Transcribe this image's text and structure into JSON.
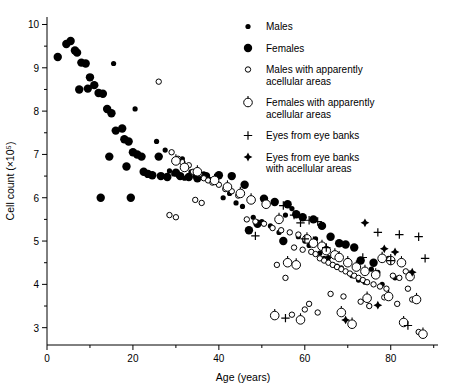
{
  "figure": {
    "background": "#ffffff",
    "ink": "#000000"
  },
  "chart_data": {
    "type": "scatter",
    "title": "",
    "xlabel": "Age (years)",
    "ylabel": "Cell count (×10⁵)",
    "xlim": [
      0,
      91
    ],
    "ylim": [
      2.6,
      10.15
    ],
    "grid": false,
    "legend_position": "top-right-inside",
    "x_major_ticks": [
      0,
      20,
      40,
      60,
      80
    ],
    "x_major_tick_labels": [
      "0",
      "20",
      "40",
      "60",
      "80"
    ],
    "x_minor_ticks": [
      10,
      30,
      50,
      70,
      90
    ],
    "y_major_ticks": [
      3,
      4,
      5,
      6,
      7,
      8,
      9,
      10
    ],
    "y_major_tick_labels": [
      "3",
      "4",
      "5",
      "6",
      "7",
      "8",
      "9",
      "10"
    ],
    "y_minor_ticks": [
      3.5,
      4.5,
      5.5,
      6.5,
      7.5,
      8.5,
      9.5
    ],
    "series": [
      {
        "name": "Males",
        "marker": "filled-circle-small",
        "color": "#000000",
        "points": [
          [
            15.5,
            9.1
          ],
          [
            20.5,
            8.05
          ],
          [
            25.5,
            7.3
          ],
          [
            27.5,
            7.1
          ],
          [
            28.5,
            6.62
          ],
          [
            29.5,
            6.55
          ],
          [
            30.5,
            6.52
          ],
          [
            31.5,
            6.9
          ],
          [
            32.0,
            6.45
          ],
          [
            33.5,
            6.6
          ],
          [
            34.5,
            6.5
          ],
          [
            36.5,
            6.55
          ],
          [
            38.0,
            6.42
          ],
          [
            39.5,
            6.35
          ],
          [
            41.0,
            6.0
          ],
          [
            42.5,
            6.1
          ],
          [
            44.0,
            5.88
          ],
          [
            45.5,
            5.8
          ],
          [
            48.0,
            5.55
          ],
          [
            50.0,
            5.45
          ],
          [
            52.0,
            5.35
          ],
          [
            54.0,
            5.2
          ],
          [
            55.5,
            5.6
          ],
          [
            57.0,
            5.75
          ],
          [
            58.5,
            5.1
          ],
          [
            60.0,
            5.0
          ],
          [
            61.0,
            4.9
          ],
          [
            62.5,
            5.05
          ],
          [
            63.5,
            4.72
          ],
          [
            64.5,
            4.6
          ],
          [
            65.5,
            4.62
          ],
          [
            66.5,
            4.45
          ],
          [
            67.5,
            4.42
          ],
          [
            68.5,
            4.38
          ],
          [
            70.0,
            4.55
          ],
          [
            71.0,
            4.2
          ],
          [
            72.5,
            4.1
          ],
          [
            74.0,
            4.05
          ],
          [
            75.5,
            4.35
          ],
          [
            77.0,
            4.28
          ],
          [
            78.0,
            4.0
          ],
          [
            79.5,
            4.6
          ],
          [
            81.0,
            4.15
          ]
        ]
      },
      {
        "name": "Females",
        "marker": "filled-circle-large",
        "color": "#000000",
        "points": [
          [
            2.5,
            9.25
          ],
          [
            4.5,
            9.55
          ],
          [
            5.5,
            9.62
          ],
          [
            6.5,
            9.4
          ],
          [
            7.0,
            9.35
          ],
          [
            8.0,
            9.12
          ],
          [
            9.0,
            9.1
          ],
          [
            10.0,
            8.78
          ],
          [
            11.0,
            8.6
          ],
          [
            12.0,
            8.42
          ],
          [
            13.0,
            8.4
          ],
          [
            9.5,
            8.52
          ],
          [
            7.5,
            8.5
          ],
          [
            14.0,
            8.05
          ],
          [
            15.0,
            7.95
          ],
          [
            16.0,
            7.55
          ],
          [
            17.5,
            7.6
          ],
          [
            18.0,
            7.35
          ],
          [
            19.0,
            7.3
          ],
          [
            20.0,
            7.05
          ],
          [
            21.0,
            7.0
          ],
          [
            22.0,
            6.95
          ],
          [
            22.5,
            6.6
          ],
          [
            23.5,
            6.55
          ],
          [
            24.5,
            6.52
          ],
          [
            26.0,
            6.95
          ],
          [
            14.5,
            6.95
          ],
          [
            18.5,
            6.72
          ],
          [
            26.5,
            6.5
          ],
          [
            28.0,
            6.48
          ],
          [
            30.0,
            6.58
          ],
          [
            31.0,
            6.5
          ],
          [
            33.0,
            6.48
          ],
          [
            35.0,
            6.45
          ],
          [
            37.0,
            6.5
          ],
          [
            40.0,
            6.52
          ],
          [
            43.0,
            6.5
          ],
          [
            46.0,
            6.3
          ],
          [
            12.5,
            6.0
          ],
          [
            19.5,
            6.0
          ],
          [
            50.5,
            5.98
          ],
          [
            53.0,
            5.9
          ],
          [
            56.0,
            5.85
          ],
          [
            58.0,
            5.62
          ],
          [
            59.5,
            5.55
          ],
          [
            62.0,
            5.5
          ],
          [
            64.0,
            5.35
          ],
          [
            66.0,
            5.1
          ],
          [
            68.0,
            4.95
          ],
          [
            69.5,
            4.92
          ],
          [
            71.5,
            4.85
          ],
          [
            73.0,
            4.55
          ],
          [
            76.0,
            4.5
          ],
          [
            55.0,
            5.0
          ],
          [
            49.0,
            5.4
          ],
          [
            47.0,
            5.25
          ]
        ]
      },
      {
        "name": "Males with apparently acellular areas",
        "marker": "open-circle-small",
        "color": "#000000",
        "points": [
          [
            26.0,
            8.68
          ],
          [
            29.0,
            7.05
          ],
          [
            30.5,
            6.9
          ],
          [
            31.5,
            6.82
          ],
          [
            33.0,
            6.75
          ],
          [
            34.0,
            6.6
          ],
          [
            35.5,
            6.55
          ],
          [
            36.5,
            6.45
          ],
          [
            37.5,
            6.4
          ],
          [
            38.5,
            6.35
          ],
          [
            40.0,
            6.3
          ],
          [
            41.5,
            6.2
          ],
          [
            43.0,
            6.15
          ],
          [
            44.5,
            6.05
          ],
          [
            34.5,
            5.95
          ],
          [
            36.0,
            5.88
          ],
          [
            28.5,
            5.6
          ],
          [
            30.0,
            5.55
          ],
          [
            46.5,
            5.5
          ],
          [
            48.5,
            5.45
          ],
          [
            50.5,
            5.4
          ],
          [
            52.5,
            5.3
          ],
          [
            54.5,
            5.25
          ],
          [
            56.5,
            5.2
          ],
          [
            58.5,
            5.15
          ],
          [
            57.5,
            4.85
          ],
          [
            59.5,
            4.8
          ],
          [
            61.5,
            4.75
          ],
          [
            62.5,
            4.7
          ],
          [
            63.5,
            4.6
          ],
          [
            64.5,
            4.55
          ],
          [
            65.5,
            4.5
          ],
          [
            66.5,
            4.45
          ],
          [
            67.5,
            4.4
          ],
          [
            68.5,
            4.35
          ],
          [
            69.5,
            4.3
          ],
          [
            70.5,
            4.25
          ],
          [
            71.5,
            4.2
          ],
          [
            72.5,
            4.15
          ],
          [
            73.5,
            4.1
          ],
          [
            74.5,
            4.05
          ],
          [
            76.0,
            4.0
          ],
          [
            77.5,
            3.95
          ],
          [
            79.0,
            3.9
          ],
          [
            80.5,
            4.2
          ],
          [
            82.0,
            4.15
          ],
          [
            83.5,
            4.3
          ],
          [
            85.0,
            3.65
          ],
          [
            86.5,
            2.9
          ],
          [
            61.0,
            3.55
          ],
          [
            55.5,
            4.15
          ],
          [
            53.5,
            4.45
          ],
          [
            57.0,
            3.3
          ],
          [
            66.0,
            3.78
          ],
          [
            69.0,
            3.72
          ],
          [
            73.0,
            3.6
          ],
          [
            78.5,
            3.7
          ],
          [
            81.5,
            3.55
          ],
          [
            84.0,
            3.9
          ],
          [
            75.0,
            3.5
          ],
          [
            60.0,
            3.42
          ],
          [
            63.0,
            3.35
          ]
        ]
      },
      {
        "name": "Females with apparently acellular areas",
        "marker": "open-circle-large",
        "color": "#000000",
        "points": [
          [
            30.0,
            6.85
          ],
          [
            32.0,
            6.7
          ],
          [
            35.0,
            6.6
          ],
          [
            39.0,
            6.4
          ],
          [
            42.0,
            6.25
          ],
          [
            45.0,
            6.1
          ],
          [
            47.5,
            5.95
          ],
          [
            51.0,
            5.85
          ],
          [
            54.0,
            5.5
          ],
          [
            56.0,
            4.5
          ],
          [
            58.0,
            4.45
          ],
          [
            60.5,
            5.05
          ],
          [
            62.0,
            4.95
          ],
          [
            64.0,
            4.88
          ],
          [
            65.0,
            4.78
          ],
          [
            67.0,
            4.68
          ],
          [
            68.0,
            4.62
          ],
          [
            70.0,
            4.5
          ],
          [
            72.0,
            4.4
          ],
          [
            74.0,
            4.3
          ],
          [
            76.5,
            4.22
          ],
          [
            78.0,
            4.6
          ],
          [
            80.0,
            4.55
          ],
          [
            82.5,
            4.5
          ],
          [
            84.5,
            4.18
          ],
          [
            86.0,
            3.65
          ],
          [
            87.5,
            2.85
          ],
          [
            68.5,
            3.35
          ],
          [
            74.5,
            3.68
          ],
          [
            79.5,
            3.72
          ],
          [
            53.0,
            3.28
          ],
          [
            59.0,
            3.18
          ],
          [
            83.0,
            3.12
          ],
          [
            71.0,
            3.08
          ]
        ]
      },
      {
        "name": "Eyes from eye banks",
        "marker": "plus",
        "color": "#000000",
        "points": [
          [
            55.0,
            5.82
          ],
          [
            57.5,
            5.6
          ],
          [
            59.0,
            5.42
          ],
          [
            61.0,
            5.48
          ],
          [
            63.0,
            5.45
          ],
          [
            48.5,
            5.12
          ],
          [
            60.0,
            5.05
          ],
          [
            65.0,
            4.85
          ],
          [
            77.0,
            5.2
          ],
          [
            82.0,
            5.15
          ],
          [
            86.5,
            5.1
          ],
          [
            88.0,
            4.6
          ],
          [
            80.0,
            4.55
          ],
          [
            55.5,
            3.22
          ],
          [
            84.0,
            3.05
          ],
          [
            73.5,
            4.62
          ]
        ]
      },
      {
        "name": "Eyes from eye banks with acellular areas",
        "marker": "filled-diamond",
        "color": "#000000",
        "points": [
          [
            74.0,
            5.42
          ],
          [
            78.5,
            4.82
          ],
          [
            81.0,
            4.75
          ],
          [
            85.0,
            4.28
          ],
          [
            69.5,
            3.18
          ],
          [
            77.0,
            3.52
          ]
        ]
      }
    ]
  },
  "legend": {
    "entries": [
      {
        "label": "Males",
        "marker": "filled-circle-small"
      },
      {
        "label": "Females",
        "marker": "filled-circle-large"
      },
      {
        "label": "Males with apparently acellular areas",
        "marker": "open-circle-small"
      },
      {
        "label": "Females with apparently acellular areas",
        "marker": "open-circle-large"
      },
      {
        "label": "Eyes from eye banks",
        "marker": "plus"
      },
      {
        "label": "Eyes from eye banks with acellular areas",
        "marker": "filled-diamond"
      }
    ],
    "lines": [
      [
        "Males"
      ],
      [
        "Females"
      ],
      [
        "Males with apparently",
        "acellular areas"
      ],
      [
        "Females with apparently",
        "acellular areas"
      ],
      [
        "Eyes from eye banks"
      ],
      [
        "Eyes from eye banks",
        "with acellular areas"
      ]
    ]
  }
}
